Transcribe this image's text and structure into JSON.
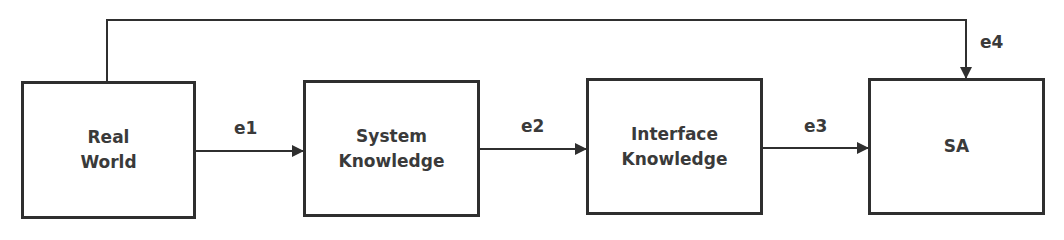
{
  "diagram": {
    "nodes": [
      {
        "id": "real-world",
        "label_line1": "Real",
        "label_line2": "World"
      },
      {
        "id": "system-knowledge",
        "label_line1": "System",
        "label_line2": "Knowledge"
      },
      {
        "id": "interface-knowledge",
        "label_line1": "Interface",
        "label_line2": "Knowledge"
      },
      {
        "id": "sa",
        "label_line1": "SA",
        "label_line2": ""
      }
    ],
    "edges": [
      {
        "id": "e1",
        "label": "e1",
        "from": "real-world",
        "to": "system-knowledge"
      },
      {
        "id": "e2",
        "label": "e2",
        "from": "system-knowledge",
        "to": "interface-knowledge"
      },
      {
        "id": "e3",
        "label": "e3",
        "from": "interface-knowledge",
        "to": "sa"
      },
      {
        "id": "e4",
        "label": "e4",
        "from": "real-world",
        "to": "sa"
      }
    ],
    "colors": {
      "stroke": "#2f2f2f",
      "text": "#3a3a3a",
      "background": "#ffffff"
    }
  }
}
